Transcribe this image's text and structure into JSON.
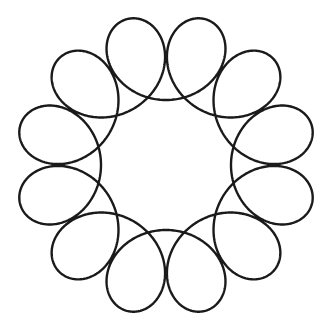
{
  "figure": {
    "lobes": 12,
    "center": [
      166,
      165
    ],
    "outer_radius": 151,
    "inner_radius": 65,
    "rotation_deg": 15,
    "stroke_color": "#1a1a1a",
    "stroke_width": 2.4,
    "background": "#ffffff"
  }
}
